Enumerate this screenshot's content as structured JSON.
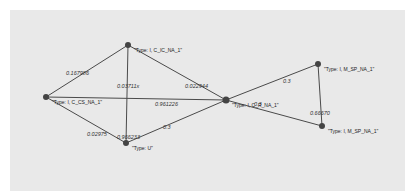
{
  "graph": {
    "nodes": [
      {
        "id": "n_cic",
        "label": "\"Type: I, C_IC_NA_1\"",
        "x": 128,
        "y": 45
      },
      {
        "id": "n_ccs",
        "label": "\"Type: I, C_CS_NA_1\"",
        "x": 46,
        "y": 97
      },
      {
        "id": "n_u",
        "label": "\"Type: U\"",
        "x": 126,
        "y": 143
      },
      {
        "id": "n_center",
        "label": "\"Type: I, C_R_NA_1\"",
        "x": 226,
        "y": 100
      },
      {
        "id": "n_msp_top",
        "label": "\"Type: I, M_SP_NA_1\"",
        "x": 318,
        "y": 64
      },
      {
        "id": "n_msp_bot",
        "label": "\"Type: I, M_SP_NA_1\"",
        "x": 322,
        "y": 126
      }
    ],
    "edges": [
      {
        "from": "n_ccs",
        "to": "n_cic",
        "label": "0.167986",
        "lx": 66,
        "ly": 75
      },
      {
        "from": "n_cic",
        "to": "n_u",
        "label": "0.03711x",
        "lx": 117,
        "ly": 88
      },
      {
        "from": "n_cic",
        "to": "n_center",
        "label": "0.022944",
        "lx": 185,
        "ly": 88
      },
      {
        "from": "n_ccs",
        "to": "n_center",
        "label": "0.961226",
        "lx": 155,
        "ly": 106
      },
      {
        "from": "n_ccs",
        "to": "n_u",
        "label": "0.02975",
        "lx": 87,
        "ly": 136
      },
      {
        "from": "n_u",
        "to": "n_center",
        "label": "0.3",
        "lx": 163,
        "ly": 129
      },
      {
        "from": "n_center",
        "to": "n_msp_top",
        "label": "0.3",
        "lx": 283,
        "ly": 83
      },
      {
        "from": "n_center",
        "to": "n_msp_bot",
        "label": "0.3",
        "lx": 254,
        "ly": 106
      },
      {
        "from": "n_msp_top",
        "to": "n_msp_bot",
        "label": "0.66670",
        "lx": 310,
        "ly": 115
      }
    ],
    "u_label_extra": "0.966233"
  }
}
